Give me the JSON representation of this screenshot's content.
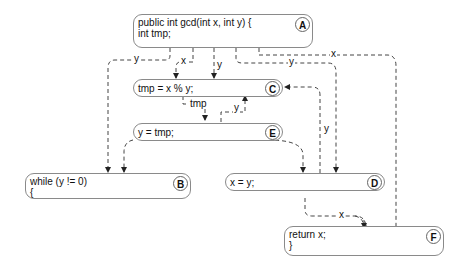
{
  "nodes": {
    "A": {
      "id": "A",
      "line1": "public int gcd(int x, int y) {",
      "line2": "int tmp;"
    },
    "B": {
      "id": "B",
      "line1": "while (y != 0)",
      "line2": "{"
    },
    "C": {
      "id": "C",
      "line1": "tmp = x % y;",
      "line2": ""
    },
    "D": {
      "id": "D",
      "line1": "x = y;",
      "line2": ""
    },
    "E": {
      "id": "E",
      "line1": "y = tmp;",
      "line2": ""
    },
    "F": {
      "id": "F",
      "line1": "return x;",
      "line2": "}"
    }
  },
  "edge_labels": {
    "a_b": "y",
    "a_c_x": "x",
    "a_c_y": "y",
    "a_d": "y",
    "a_f": "x",
    "c_e": "tmp",
    "e_c": "y",
    "d_c": "y",
    "d_f": "x"
  },
  "colors": {
    "edge": "#333333",
    "border": "#8a8a8a"
  }
}
